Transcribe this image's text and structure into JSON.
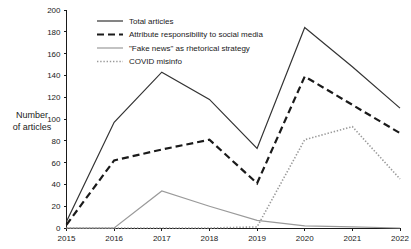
{
  "chart_data": {
    "type": "line",
    "title": "",
    "xlabel": "",
    "ylabel": "Number of articles",
    "ylabel_line1": "Number",
    "ylabel_line2": "of articles",
    "categories": [
      "2015",
      "2016",
      "2017",
      "2018",
      "2019",
      "2020",
      "2021",
      "2022"
    ],
    "x": [
      2015,
      2016,
      2017,
      2018,
      2019,
      2020,
      2021,
      2022
    ],
    "xlim": [
      2015,
      2022
    ],
    "ylim": [
      0,
      200
    ],
    "ytick_labels": [
      "0",
      "20",
      "40",
      "60",
      "80",
      "100",
      "120",
      "140",
      "160",
      "180",
      "200"
    ],
    "yticks": [
      0,
      20,
      40,
      60,
      80,
      100,
      120,
      140,
      160,
      180,
      200
    ],
    "grid": false,
    "legend_position": "upper-left-inside",
    "series": [
      {
        "name": "Total articles",
        "style": "solid",
        "color": "#333333",
        "width": 1.2,
        "values": [
          6,
          97,
          143,
          118,
          73,
          184,
          148,
          110
        ]
      },
      {
        "name": "Attribute responsibility to social media",
        "style": "dashed",
        "color": "#1a1a1a",
        "width": 2.2,
        "values": [
          3,
          62,
          72,
          81,
          41,
          139,
          113,
          87
        ]
      },
      {
        "name": "\"Fake news\" as rhetorical strategy",
        "style": "solid",
        "color": "#9a9a9a",
        "width": 1.2,
        "values": [
          0,
          0,
          34,
          20,
          7,
          2,
          1,
          0
        ]
      },
      {
        "name": "COVID misinfo",
        "style": "dotted",
        "color": "#9a9a9a",
        "width": 1.6,
        "values": [
          0,
          0,
          0,
          0,
          1,
          81,
          93,
          45
        ]
      }
    ]
  },
  "legend": {
    "items": [
      {
        "label": "Total articles"
      },
      {
        "label": "Attribute responsibility to social media"
      },
      {
        "label": "\"Fake news\" as rhetorical strategy"
      },
      {
        "label": "COVID misinfo"
      }
    ]
  }
}
